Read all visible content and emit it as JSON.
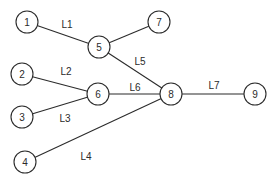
{
  "diagram": {
    "type": "network-graph",
    "node_radius": 11,
    "stroke_color": "#2b2b2b",
    "background": "#ffffff",
    "nodes": [
      {
        "id": "1",
        "label": "1",
        "x": 27,
        "y": 22
      },
      {
        "id": "2",
        "label": "2",
        "x": 22,
        "y": 74
      },
      {
        "id": "3",
        "label": "3",
        "x": 22,
        "y": 117
      },
      {
        "id": "4",
        "label": "4",
        "x": 25,
        "y": 162
      },
      {
        "id": "5",
        "label": "5",
        "x": 99,
        "y": 47
      },
      {
        "id": "6",
        "label": "6",
        "x": 98,
        "y": 94
      },
      {
        "id": "7",
        "label": "7",
        "x": 159,
        "y": 22
      },
      {
        "id": "8",
        "label": "8",
        "x": 171,
        "y": 94
      },
      {
        "id": "9",
        "label": "9",
        "x": 255,
        "y": 94
      }
    ],
    "edges": [
      {
        "id": "L1",
        "label": "L1",
        "from": "1",
        "to": "5",
        "label_x": 67,
        "label_y": 24
      },
      {
        "id": "L2",
        "label": "L2",
        "from": "2",
        "to": "6",
        "label_x": 66,
        "label_y": 71
      },
      {
        "id": "L3",
        "label": "L3",
        "from": "3",
        "to": "6",
        "label_x": 65,
        "label_y": 118
      },
      {
        "id": "L4",
        "label": "L4",
        "from": "4",
        "to": "8",
        "label_x": 86,
        "label_y": 156
      },
      {
        "id": "L5",
        "label": "L5",
        "from": "5",
        "to": "8",
        "label_x": 140,
        "label_y": 61
      },
      {
        "id": "L6",
        "label": "L6",
        "from": "6",
        "to": "8",
        "label_x": 135,
        "label_y": 87
      },
      {
        "id": "L7",
        "label": "L7",
        "from": "8",
        "to": "9",
        "label_x": 214,
        "label_y": 85
      },
      {
        "id": "E57",
        "label": "",
        "from": "5",
        "to": "7",
        "label_x": null,
        "label_y": null
      }
    ]
  }
}
